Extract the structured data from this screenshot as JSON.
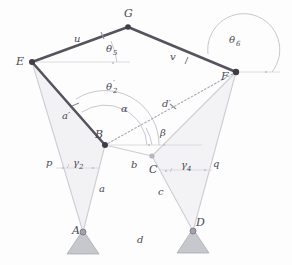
{
  "figure": {
    "type": "kinematic-linkage-diagram",
    "background_color": "#fdfdfd",
    "link_color": "#56535f",
    "thin_color": "#cfcfd6",
    "arc_color": "#c4c2cc",
    "ground_color": "#bdbdc4",
    "joint_color": "#3f3d46",
    "label_color": "#4a4a52"
  },
  "points": {
    "A": {
      "label": "A",
      "x": 83,
      "y": 232,
      "grounded": true
    },
    "B": {
      "label": "B",
      "x": 105,
      "y": 145,
      "grounded": false
    },
    "C": {
      "label": "C",
      "x": 152,
      "y": 156,
      "grounded": false
    },
    "D": {
      "label": "D",
      "x": 193,
      "y": 231,
      "grounded": true
    },
    "E": {
      "label": "E",
      "x": 32,
      "y": 62,
      "grounded": false
    },
    "F": {
      "label": "F",
      "x": 236,
      "y": 72,
      "grounded": false
    },
    "G": {
      "label": "G",
      "x": 128,
      "y": 27,
      "grounded": false
    }
  },
  "point_labels": [
    {
      "name": "A",
      "text": "A",
      "x": 72,
      "y": 234
    },
    {
      "name": "B",
      "text": "B",
      "x": 95,
      "y": 138
    },
    {
      "name": "C",
      "text": "C",
      "x": 150,
      "y": 171
    },
    {
      "name": "D",
      "text": "D",
      "x": 196,
      "y": 226
    },
    {
      "name": "E",
      "text": "E",
      "x": 18,
      "y": 62
    },
    {
      "name": "F",
      "text": "F",
      "x": 224,
      "y": 78
    },
    {
      "name": "G",
      "text": "G",
      "x": 125,
      "y": 16
    }
  ],
  "length_labels": [
    {
      "name": "u",
      "text": "u",
      "x": 76,
      "y": 40
    },
    {
      "name": "v",
      "text": "v",
      "x": 172,
      "y": 57
    },
    {
      "name": "a-prime",
      "text": "a′",
      "x": 65,
      "y": 117
    },
    {
      "name": "a",
      "text": "a",
      "x": 101,
      "y": 190
    },
    {
      "name": "b",
      "text": "b",
      "x": 133,
      "y": 165
    },
    {
      "name": "c",
      "text": "c",
      "x": 160,
      "y": 192
    },
    {
      "name": "d",
      "text": "d",
      "x": 139,
      "y": 241
    },
    {
      "name": "d-prime",
      "text": "d′",
      "x": 165,
      "y": 105
    },
    {
      "name": "p",
      "text": "p",
      "x": 49,
      "y": 163
    },
    {
      "name": "q",
      "text": "q",
      "x": 215,
      "y": 164
    }
  ],
  "angle_labels": [
    {
      "name": "theta-5",
      "base": "θ",
      "subscript": "5",
      "x": 110,
      "y": 50
    },
    {
      "name": "theta-6",
      "base": "θ",
      "subscript": "6",
      "x": 232,
      "y": 41
    },
    {
      "name": "theta-2-prime",
      "base": "θ",
      "subscript": "2",
      "prime": "′",
      "x": 110,
      "y": 88
    },
    {
      "name": "alpha",
      "base": "α",
      "subscript": "",
      "x": 124,
      "y": 110
    },
    {
      "name": "beta",
      "base": "β",
      "subscript": "",
      "x": 163,
      "y": 133
    },
    {
      "name": "gamma-2",
      "base": "γ",
      "subscript": "2",
      "x": 76,
      "y": 164
    },
    {
      "name": "gamma-4",
      "base": "γ",
      "subscript": "4",
      "x": 184,
      "y": 166
    }
  ],
  "links": [
    {
      "name": "link-EG",
      "from": "E",
      "to": "G",
      "style": "thick",
      "tick": true
    },
    {
      "name": "link-GF",
      "from": "G",
      "to": "F",
      "style": "thick",
      "tick": true
    },
    {
      "name": "link-EB",
      "from": "E",
      "to": "B",
      "style": "thick",
      "tick": true
    },
    {
      "name": "link-AB",
      "from": "A",
      "to": "B",
      "style": "thin"
    },
    {
      "name": "link-AE",
      "from": "A",
      "to": "E",
      "style": "thin"
    },
    {
      "name": "link-BC",
      "from": "B",
      "to": "C",
      "style": "thin"
    },
    {
      "name": "link-CD",
      "from": "C",
      "to": "D",
      "style": "thin"
    },
    {
      "name": "link-CF",
      "from": "C",
      "to": "F",
      "style": "thin"
    },
    {
      "name": "link-DF",
      "from": "D",
      "to": "F",
      "style": "thin"
    },
    {
      "name": "link-BF-diagonal",
      "from": "B",
      "to": "F",
      "style": "dotted"
    }
  ],
  "reference_rays": [
    {
      "name": "ray-E-horizontal",
      "x1": 32,
      "y1": 62,
      "x2": 128,
      "y2": 62
    },
    {
      "name": "ray-F-horizontal",
      "x1": 236,
      "y1": 72,
      "x2": 278,
      "y2": 72
    },
    {
      "name": "ray-B-horizontal",
      "x1": 105,
      "y1": 145,
      "x2": 200,
      "y2": 145
    }
  ]
}
